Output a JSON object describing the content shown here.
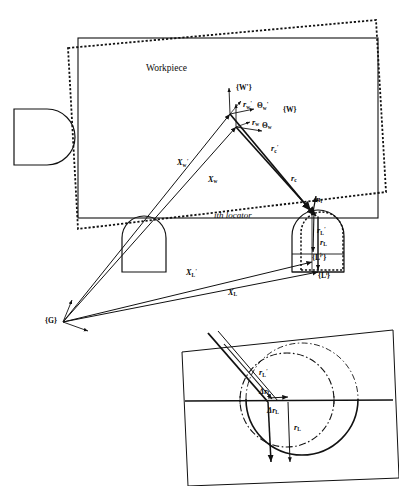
{
  "figure": {
    "type": "engineering-diagram",
    "title_label": "Workpiece",
    "locator_label": "ith locator",
    "frames": {
      "workpiece_perturbed": "{W'}",
      "workpiece_nominal": "{W}",
      "locator_perturbed": "{Lⁱ'}",
      "locator_nominal": "{Lⁱ}",
      "global": "{G}"
    },
    "orientation_labels": {
      "theta_perturbed": "Θ",
      "theta_perturbed_sub": "w",
      "theta_perturbed_prime": "'",
      "theta_nominal": "Θ",
      "theta_nominal_sub": "w"
    },
    "vectors": [
      {
        "name": "X_w_prime",
        "base": "X",
        "sub": "w",
        "prime": "'"
      },
      {
        "name": "X_w",
        "base": "X",
        "sub": "w",
        "prime": ""
      },
      {
        "name": "X_L_prime",
        "base": "X",
        "sub": "L",
        "prime": "'"
      },
      {
        "name": "X_L",
        "base": "X",
        "sub": "L",
        "prime": ""
      },
      {
        "name": "r_c_prime",
        "base": "r",
        "sub": "c",
        "prime": "'"
      },
      {
        "name": "r_c",
        "base": "r",
        "sub": "c",
        "prime": ""
      },
      {
        "name": "r_w_prime",
        "base": "r",
        "sub": "w",
        "prime": "'"
      },
      {
        "name": "r_w",
        "base": "r",
        "sub": "w",
        "prime": ""
      },
      {
        "name": "r_L_prime",
        "base": "r",
        "sub": "L",
        "prime": "'"
      },
      {
        "name": "r_L",
        "base": "r",
        "sub": "L",
        "prime": ""
      },
      {
        "name": "n_i",
        "base": "n",
        "sub": "i",
        "prime": ""
      }
    ],
    "inset": {
      "r_L_prime": {
        "base": "r",
        "sub": "L",
        "prime": "'"
      },
      "delta_r_L_upper": {
        "base": "Δr",
        "sub": "L"
      },
      "delta_r_L_lower": {
        "base": "Δr",
        "sub": "L"
      },
      "r_L": {
        "base": "r",
        "sub": "L"
      }
    },
    "colors": {
      "line": "#111111",
      "background": "#ffffff"
    }
  }
}
